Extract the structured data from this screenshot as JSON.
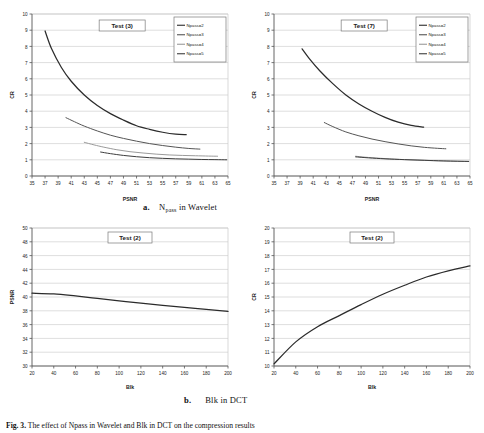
{
  "figure": {
    "caption_label": "Fig. 3.",
    "caption_text": "The effect of Npass in Wavelet and Blk in DCT on the compression results",
    "sub_caption_a_label": "a.",
    "sub_caption_a_text": "Npass in Wavelet",
    "sub_caption_a_main": "N",
    "sub_caption_a_sub": "pass",
    "sub_caption_a_tail": " in Wavelet",
    "sub_caption_b_label": "b.",
    "sub_caption_b_text": "Blk in DCT"
  },
  "colors": {
    "series1": "#2b2b2b",
    "series2": "#555555",
    "series3": "#9a9a9a",
    "series4": "#3d3d3d",
    "grid": "#c8c8c8",
    "axis": "#555555",
    "plot_bg": "#ffffff",
    "border": "#7a7a7a"
  },
  "chart_data": [
    {
      "id": "chart-top-left",
      "type": "line",
      "title": "Test (3)",
      "xlabel": "PSNR",
      "ylabel": "CR",
      "xlim": [
        35,
        65
      ],
      "ylim": [
        0,
        10
      ],
      "xticks": [
        35,
        37,
        39,
        41,
        43,
        45,
        47,
        49,
        51,
        53,
        55,
        57,
        59,
        61,
        63,
        65
      ],
      "yticks": [
        0,
        1,
        2,
        3,
        4,
        5,
        6,
        7,
        8,
        9,
        10
      ],
      "grid": true,
      "legend_position": "top-right",
      "series": [
        {
          "name": "Npass=2",
          "x": [
            37.0,
            38.0,
            39.5,
            41.0,
            43.0,
            45.0,
            47.0,
            49.0,
            51.0,
            53.0,
            55.0,
            57.0,
            58.6
          ],
          "y": [
            8.95,
            7.85,
            6.7,
            5.85,
            5.0,
            4.35,
            3.85,
            3.45,
            3.1,
            2.88,
            2.7,
            2.58,
            2.55
          ]
        },
        {
          "name": "Npass=3",
          "x": [
            40.2,
            41.5,
            43.0,
            45.0,
            47.0,
            49.0,
            51.0,
            53.0,
            55.0,
            57.0,
            59.0,
            60.7
          ],
          "y": [
            3.6,
            3.35,
            3.08,
            2.78,
            2.52,
            2.32,
            2.15,
            2.0,
            1.88,
            1.78,
            1.7,
            1.66
          ]
        },
        {
          "name": "Npass=4",
          "x": [
            43.0,
            44.5,
            46.0,
            48.0,
            50.0,
            52.0,
            54.0,
            56.0,
            58.0,
            60.0,
            62.0,
            63.4
          ],
          "y": [
            2.08,
            1.92,
            1.78,
            1.62,
            1.5,
            1.42,
            1.35,
            1.3,
            1.27,
            1.25,
            1.23,
            1.22
          ]
        },
        {
          "name": "Npass=5",
          "x": [
            45.5,
            47.0,
            49.0,
            51.0,
            53.0,
            55.0,
            57.0,
            59.0,
            61.0,
            63.0,
            64.8
          ],
          "y": [
            1.48,
            1.38,
            1.27,
            1.19,
            1.13,
            1.09,
            1.06,
            1.04,
            1.02,
            1.01,
            1.0
          ]
        }
      ]
    },
    {
      "id": "chart-top-right",
      "type": "line",
      "title": "Test (7)",
      "xlabel": "PSNR",
      "ylabel": "CR",
      "xlim": [
        35,
        65
      ],
      "ylim": [
        0,
        10
      ],
      "xticks": [
        35,
        37,
        39,
        41,
        43,
        45,
        47,
        49,
        51,
        53,
        55,
        57,
        59,
        61,
        63,
        65
      ],
      "yticks": [
        0,
        1,
        2,
        3,
        4,
        5,
        6,
        7,
        8,
        9,
        10
      ],
      "grid": true,
      "legend_position": "top-right",
      "series": [
        {
          "name": "Npass=2",
          "x": [
            39.3,
            40.5,
            42.0,
            44.0,
            46.0,
            48.0,
            50.0,
            52.0,
            54.0,
            56.0,
            57.9
          ],
          "y": [
            7.85,
            7.2,
            6.5,
            5.7,
            5.0,
            4.45,
            4.0,
            3.62,
            3.32,
            3.12,
            3.02
          ]
        },
        {
          "name": "Npass=3",
          "x": [
            42.7,
            44.0,
            46.0,
            48.0,
            50.0,
            52.0,
            54.0,
            56.0,
            58.0,
            60.0,
            61.3
          ],
          "y": [
            3.3,
            3.05,
            2.72,
            2.48,
            2.28,
            2.12,
            1.98,
            1.86,
            1.77,
            1.71,
            1.68
          ]
        },
        {
          "name": "Npass=4",
          "x": [
            47.5,
            49.0,
            51.0,
            53.0,
            55.0,
            57.0,
            59.0,
            61.0,
            63.0,
            64.8
          ],
          "y": [
            1.22,
            1.16,
            1.1,
            1.05,
            1.01,
            0.98,
            0.95,
            0.93,
            0.91,
            0.9
          ]
        },
        {
          "name": "Npass=5",
          "x": [
            47.5,
            49.5,
            52.0,
            55.0,
            58.0,
            61.0,
            64.8
          ],
          "y": [
            1.18,
            1.12,
            1.06,
            1.01,
            0.97,
            0.93,
            0.9
          ]
        }
      ]
    },
    {
      "id": "chart-bottom-left",
      "type": "line",
      "title": "Test (2)",
      "xlabel": "Blk",
      "ylabel": "PSNR",
      "xlim": [
        20,
        200
      ],
      "ylim": [
        30,
        50
      ],
      "xticks": [
        20,
        40,
        60,
        80,
        100,
        120,
        140,
        160,
        180,
        200
      ],
      "yticks": [
        30,
        32,
        34,
        36,
        38,
        40,
        42,
        44,
        46,
        48,
        50
      ],
      "grid": true,
      "legend_position": "none",
      "series": [
        {
          "name": "PSNR vs Blk",
          "x": [
            20,
            40,
            60,
            80,
            100,
            120,
            140,
            160,
            180,
            200
          ],
          "y": [
            40.55,
            40.45,
            40.15,
            39.8,
            39.45,
            39.1,
            38.8,
            38.5,
            38.2,
            37.9
          ]
        }
      ]
    },
    {
      "id": "chart-bottom-right",
      "type": "line",
      "title": "Test (2)",
      "xlabel": "Blk",
      "ylabel": "CR",
      "xlim": [
        20,
        200
      ],
      "ylim": [
        10,
        20
      ],
      "xticks": [
        20,
        40,
        60,
        80,
        100,
        120,
        140,
        160,
        180,
        200
      ],
      "yticks": [
        10,
        11,
        12,
        13,
        14,
        15,
        16,
        17,
        18,
        19,
        20
      ],
      "grid": true,
      "legend_position": "none",
      "series": [
        {
          "name": "CR vs Blk",
          "x": [
            20,
            40,
            60,
            80,
            100,
            120,
            140,
            160,
            180,
            200
          ],
          "y": [
            10.15,
            11.75,
            12.85,
            13.65,
            14.45,
            15.2,
            15.85,
            16.45,
            16.9,
            17.25
          ]
        }
      ]
    }
  ]
}
